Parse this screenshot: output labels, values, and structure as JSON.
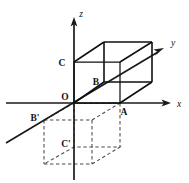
{
  "figure": {
    "background_color": "#ffffff",
    "stroke_color": "#111111",
    "dashed_color": "#4a4a4a",
    "axes": [
      {
        "name": "z",
        "label": "z",
        "label_x": 80,
        "label_y": 16,
        "direction": "up"
      },
      {
        "name": "y",
        "label": "y",
        "label_x": 172,
        "label_y": 45,
        "direction": "up-right"
      },
      {
        "name": "x",
        "label": "x",
        "label_x": 177,
        "label_y": 106,
        "direction": "right"
      }
    ],
    "points": [
      {
        "name": "C",
        "label": "C",
        "label_x": 62,
        "label_y": 66,
        "px": 74,
        "py": 62
      },
      {
        "name": "B",
        "label": "B",
        "label_x": 94,
        "label_y": 85,
        "px": 104,
        "py": 82
      },
      {
        "name": "O",
        "label": "O",
        "label_x": 63,
        "label_y": 100,
        "px": 74,
        "py": 103
      },
      {
        "name": "A",
        "label": "A",
        "label_x": 123,
        "label_y": 114,
        "px": 120,
        "py": 103
      },
      {
        "name": "Bp",
        "label": "B'",
        "label_x": 33,
        "label_y": 121,
        "px": 44,
        "py": 120
      },
      {
        "name": "Cp",
        "label": "C'",
        "label_x": 64,
        "label_y": 147,
        "px": 74,
        "py": 143
      }
    ],
    "solid_cube": {
      "description": "upper cube resting above the xy-plane",
      "vertices": {
        "front_bottom_left": [
          104,
          82
        ],
        "front_bottom_right": [
          152,
          82
        ],
        "front_top_left": [
          104,
          42
        ],
        "front_top_right": [
          152,
          42
        ],
        "back_bottom_left": [
          74,
          103
        ],
        "back_bottom_right": [
          120,
          103
        ],
        "back_top_left": [
          74,
          62
        ],
        "back_top_right": [
          120,
          62
        ]
      }
    },
    "dashed_cube": {
      "description": "lower reflected cube below the xy-plane",
      "vertices": {
        "front_bottom_left": [
          44,
          120
        ],
        "front_bottom_right": [
          92,
          120
        ],
        "front_top_left": [
          44,
          165
        ],
        "front_top_right": [
          92,
          165
        ],
        "back_bottom_left": [
          74,
          143
        ],
        "back_bottom_right": [
          120,
          143
        ],
        "back_top_left": [
          74,
          180
        ],
        "back_top_right": [
          120,
          180
        ]
      }
    }
  }
}
